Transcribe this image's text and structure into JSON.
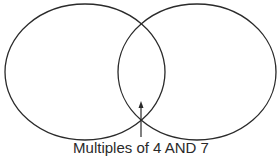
{
  "diagram": {
    "type": "venn",
    "stroke_color": "#2a2a2a",
    "circles": [
      {
        "name": "left-set",
        "cx": 85,
        "cy": 72,
        "rx": 80,
        "ry": 68
      },
      {
        "name": "right-set",
        "cx": 197,
        "cy": 72,
        "rx": 79,
        "ry": 68
      }
    ],
    "arrow": {
      "x": 141,
      "y_from": 137,
      "y_to": 102
    },
    "label": "Multiples of 4 AND 7"
  }
}
